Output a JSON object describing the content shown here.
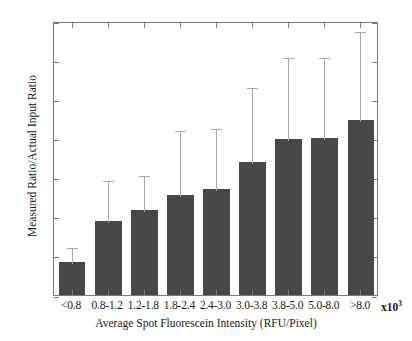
{
  "chart_data": {
    "type": "bar",
    "title": "",
    "xlabel": "Average Spot Fluorescein Intensity (RFU/Pixel)",
    "ylabel": "Measured Ratio/Actual Input Ratio",
    "x_multiplier": "x10",
    "x_multiplier_exp": "3",
    "categories": [
      "<0.8",
      "0.8-1.2",
      "1.2-1.8",
      "1.8-2.4",
      "2.4-3.0",
      "3.0-3.8",
      "3.8-5.0",
      "5.0-8.0",
      ">8.0"
    ],
    "values": [
      0.042,
      0.094,
      0.109,
      0.128,
      0.135,
      0.17,
      0.199,
      0.2,
      0.224
    ],
    "error_upper": [
      0.062,
      0.148,
      0.155,
      0.212,
      0.215,
      0.267,
      0.305,
      0.305,
      0.338
    ],
    "ylim": [
      0,
      0.35
    ],
    "yticks": [
      0,
      0.05,
      0.1,
      0.15,
      0.2,
      0.25,
      0.3,
      0.35
    ],
    "ytick_labels": [
      "0",
      "0.05",
      "0.1",
      "0.15",
      "0.2",
      "0.25",
      "0.3",
      "0.35"
    ],
    "grid": false,
    "legend": null,
    "bar_color": "#474747",
    "error_color": "#a8a8a8",
    "axis_color": "#7a7a7a",
    "error_bars": "upper-only"
  }
}
